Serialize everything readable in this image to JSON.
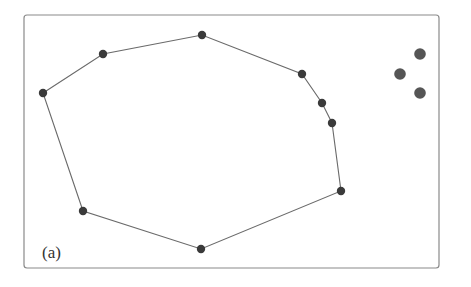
{
  "panel": {
    "label": "(a)",
    "frame": {
      "x": 24,
      "y": 15,
      "width": 415,
      "height": 253,
      "radius": 3,
      "stroke": "#8a8a8a"
    }
  },
  "colors": {
    "edge": "#6a6a6a",
    "vertex": "#3a3a3a",
    "outlier": "#555555"
  },
  "polygon": {
    "vertices": [
      {
        "x": 43,
        "y": 93
      },
      {
        "x": 103,
        "y": 54
      },
      {
        "x": 202,
        "y": 35
      },
      {
        "x": 302,
        "y": 74
      },
      {
        "x": 322,
        "y": 103
      },
      {
        "x": 332,
        "y": 123
      },
      {
        "x": 341,
        "y": 191
      },
      {
        "x": 201,
        "y": 249
      },
      {
        "x": 83,
        "y": 211
      }
    ],
    "vertex_radius": 4.2
  },
  "outliers": {
    "points": [
      {
        "x": 420,
        "y": 54
      },
      {
        "x": 400,
        "y": 74
      },
      {
        "x": 420,
        "y": 93
      }
    ],
    "radius": 5.8
  }
}
